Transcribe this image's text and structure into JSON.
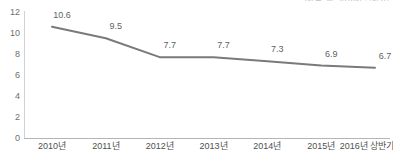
{
  "chart_data": {
    "type": "line",
    "title": "",
    "subtitle": "",
    "unit_note": "(단위: %, 2016년 상반기)",
    "categories": [
      "2010년",
      "2011년",
      "2012년",
      "2013년",
      "2014년",
      "2015년",
      "2016년 상반기"
    ],
    "values": [
      10.6,
      9.5,
      7.7,
      7.7,
      7.3,
      6.9,
      6.7
    ],
    "point_labels": [
      "10.6",
      "9.5",
      "7.7",
      "7.7",
      "7.3",
      "6.9",
      "6.7"
    ],
    "series": [
      {
        "name": "",
        "values": [
          10.6,
          9.5,
          7.7,
          7.7,
          7.3,
          6.9,
          6.7
        ]
      }
    ],
    "xlabel": "",
    "ylabel": "",
    "ylim": [
      0,
      12
    ],
    "yticks": [
      "0",
      "2",
      "4",
      "6",
      "8",
      "10",
      "12"
    ],
    "ytick_values": [
      0,
      2,
      4,
      6,
      8,
      10,
      12
    ],
    "grid": false,
    "legend": false,
    "legend_position": "none",
    "markers": false,
    "line_color": "#7a7a7a",
    "axis_color": "#b5b5b5",
    "label_color": "#5f5f5f",
    "background_color": "#ffffff"
  }
}
